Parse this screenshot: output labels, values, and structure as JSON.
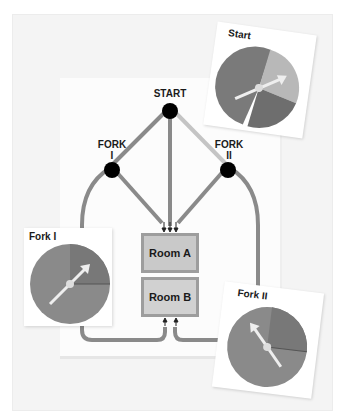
{
  "diagram": {
    "nodes": {
      "start": "START",
      "fork1_line1": "FORK",
      "fork1_line2": "I",
      "fork2_line1": "FORK",
      "fork2_line2": "II"
    },
    "rooms": {
      "a": "Room A",
      "b": "Room B"
    },
    "spinners": {
      "start": {
        "title": "Start",
        "sectors": [
          "dark",
          "light",
          "medium-dark"
        ],
        "pointer": "light sector"
      },
      "fork1": {
        "title": "Fork I",
        "sectors": [
          "medium",
          "dark-quarter"
        ],
        "pointer": "dark-quarter sector"
      },
      "fork2": {
        "title": "Fork II",
        "sectors": [
          "medium",
          "dark-quarter"
        ],
        "pointer": "medium sector"
      }
    },
    "colors": {
      "path_dark": "#8a8a8a",
      "path_light": "#c4c4c4",
      "node": "#000000",
      "spinner_dark": "#7a7a7a",
      "spinner_medium": "#8c8c8c",
      "spinner_light": "#b8b8b8",
      "room_fill": "#c9c9c9",
      "room_border": "#9d9d9d"
    }
  }
}
